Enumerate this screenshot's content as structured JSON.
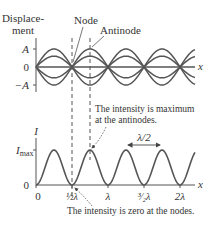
{
  "colors": {
    "curve": "#555555",
    "axis": "#555555",
    "text": "#333333",
    "annotation": "#444444"
  },
  "top_plot": {
    "ylabel_line1": "Displace-",
    "ylabel_line2": "ment",
    "tick_A": "A",
    "tick_zero": "0",
    "tick_negA": "−A",
    "xlabel": "x",
    "node_label": "Node",
    "antinode_label": "Antinode"
  },
  "bottom_plot": {
    "ylabel": "I",
    "tick_imax_main": "I",
    "tick_imax_sub": "max",
    "tick_zero": "0",
    "xlabel": "x",
    "xticks": [
      "0",
      "½λ",
      "λ",
      "³⁄₂λ",
      "2λ"
    ],
    "half_wavelength_label": "λ/2"
  },
  "annotations": {
    "max_line1": "The intensity is maximum",
    "max_line2": "at the antinodes.",
    "zero_note": "The intensity is zero at the nodes."
  },
  "chart_data": {
    "type": "line",
    "panels": [
      {
        "name": "displacement",
        "xlabel": "x",
        "ylabel": "Displacement",
        "yticks": [
          "A",
          "0",
          "-A"
        ],
        "series": [
          {
            "name": "amplitude +A",
            "amplitude": 1.0
          },
          {
            "name": "amplitude +0.6A",
            "amplitude": 0.6
          },
          {
            "name": "amplitude 0",
            "amplitude": 0.0
          },
          {
            "name": "amplitude -0.6A",
            "amplitude": -0.6
          },
          {
            "name": "amplitude -A",
            "amplitude": -1.0
          }
        ],
        "nodes_at_wavelengths": [
          0,
          0.5,
          1,
          1.5,
          2
        ],
        "annotations": [
          "Node",
          "Antinode"
        ]
      },
      {
        "name": "intensity",
        "xlabel": "x",
        "ylabel": "I",
        "yticks": [
          "I_max",
          "0"
        ],
        "xticks": [
          "0",
          "1/2 λ",
          "λ",
          "3/2 λ",
          "2λ"
        ],
        "x": [
          0,
          0.25,
          0.5,
          0.75,
          1.0,
          1.25,
          1.5,
          1.75,
          2.0
        ],
        "values": [
          0,
          1,
          0,
          1,
          0,
          1,
          0,
          1,
          0
        ],
        "annotations": [
          "λ/2 (peak spacing)",
          "The intensity is maximum at the antinodes.",
          "The intensity is zero at the nodes."
        ]
      }
    ]
  }
}
